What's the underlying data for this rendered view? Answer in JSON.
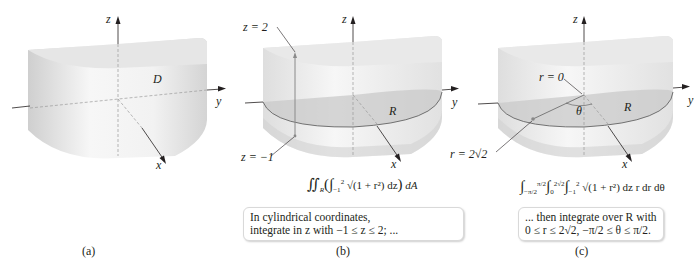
{
  "panels": [
    {
      "id": "a",
      "caption": "(a)",
      "axis_labels": {
        "x": "x",
        "y": "y",
        "z": "z"
      },
      "region_label": "D"
    },
    {
      "id": "b",
      "caption": "(b)",
      "axis_labels": {
        "x": "x",
        "y": "y",
        "z": "z"
      },
      "region_label": "R",
      "annotations": {
        "top": "z = 2",
        "bottom": "z = −1"
      },
      "formula": {
        "outer": "∬",
        "outer_sub": "R",
        "inner_lower": "−1",
        "inner_upper": "2",
        "integrand": "√(1 + r²) dz",
        "outer_diff": "dA"
      },
      "note_lines": [
        "In cylindrical coordinates,",
        "integrate in z with −1 ≤ z ≤ 2; ..."
      ]
    },
    {
      "id": "c",
      "caption": "(c)",
      "axis_labels": {
        "x": "x",
        "y": "y",
        "z": "z"
      },
      "region_label": "R",
      "annotations": {
        "center": "r = 0",
        "edge": "r = 2√2",
        "angle": "θ"
      },
      "formula": {
        "theta_lower": "−π/2",
        "theta_upper": "π/2",
        "r_lower": "0",
        "r_upper": "2√2",
        "z_lower": "−1",
        "z_upper": "2",
        "integrand": "√(1 + r²) dz r dr dθ"
      },
      "note_lines": [
        "... then integrate over R with",
        "0 ≤ r ≤ 2√2, −π/2 ≤ θ ≤ π/2."
      ]
    }
  ],
  "colors": {
    "solid_light": "#f4f4f4",
    "solid_mid": "#e3e3e3",
    "solid_dark": "#cfcfcf",
    "region_fill": "#c9c9c9",
    "axis": "#231f20",
    "dashed": "#9a9a9a",
    "vertical_segment": "#8a8a8a",
    "point": "#888888"
  }
}
